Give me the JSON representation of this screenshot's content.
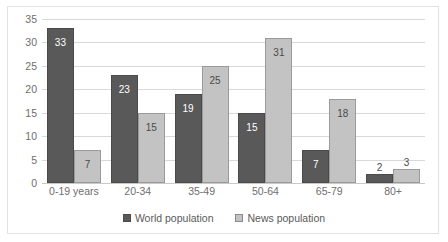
{
  "chart_data": {
    "type": "bar",
    "title": "",
    "subtitle": "",
    "xlabel": "",
    "ylabel": "",
    "ylim": [
      0,
      35
    ],
    "yticks": [
      0,
      5,
      10,
      15,
      20,
      25,
      30,
      35
    ],
    "ytick_labels": [
      "0",
      "5",
      "10",
      "15",
      "20",
      "25",
      "30",
      "35"
    ],
    "grid": true,
    "legend_position": "bottom",
    "categories": [
      "0-19 years",
      "20-34",
      "35-49",
      "50-64",
      "65-79",
      "80+"
    ],
    "series": [
      {
        "name": "World population",
        "color": "#595959",
        "border": "#4a4a4a",
        "values": [
          33,
          23,
          19,
          15,
          7,
          2
        ],
        "labels": [
          "33",
          "23",
          "19",
          "15",
          "7",
          "2"
        ]
      },
      {
        "name": "News population",
        "color": "#c3c3c3",
        "border": "#9a9a9a",
        "values": [
          7,
          15,
          25,
          31,
          18,
          3
        ],
        "labels": [
          "7",
          "15",
          "25",
          "31",
          "18",
          "3"
        ]
      }
    ]
  },
  "legend": {
    "items": [
      {
        "label": "World population",
        "swatch": "legend-swatch-world"
      },
      {
        "label": "News population",
        "swatch": "legend-swatch-news"
      }
    ]
  }
}
